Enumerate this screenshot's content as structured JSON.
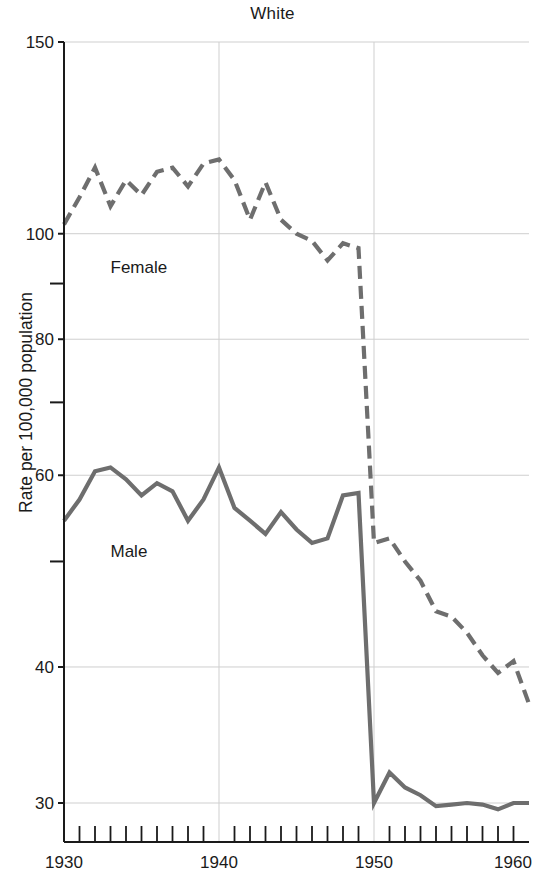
{
  "chart_data": {
    "type": "line",
    "title": "White",
    "xlabel": "",
    "ylabel": "Rate per 100,000 population",
    "yscale": "log",
    "ylim": [
      29,
      150
    ],
    "xlim": [
      1930,
      1960
    ],
    "grid": true,
    "legend_position": "inline-annotation",
    "y_major_ticks": [
      150,
      100,
      80,
      60,
      40,
      30
    ],
    "y_major_tick_labels": [
      "150",
      "100",
      "80",
      "60",
      "40",
      "30"
    ],
    "y_minor_ticks": [
      90,
      70,
      50
    ],
    "x_major_ticks": [
      1930,
      1940,
      1950,
      1960
    ],
    "x_major_tick_labels": [
      "1930",
      "1940",
      "1950",
      "1960"
    ],
    "x_minor_tick_step": 1,
    "line_color": "#6e6e6e",
    "series": [
      {
        "name": "Female",
        "style": "dashed",
        "x": [
          1930,
          1931,
          1932,
          1933,
          1934,
          1935,
          1936,
          1937,
          1938,
          1939,
          1940,
          1941,
          1942,
          1943,
          1944,
          1945,
          1946,
          1947,
          1948,
          1949,
          1950,
          1951,
          1952,
          1953,
          1954,
          1955,
          1956,
          1957,
          1958,
          1959,
          1960
        ],
        "values": [
          102,
          108,
          115,
          106,
          112,
          108.5,
          114,
          115,
          110.5,
          116,
          117,
          112,
          103,
          111.5,
          103,
          100,
          98.5,
          94.5,
          98,
          97,
          52,
          52.5,
          50,
          48,
          45,
          44.5,
          43,
          41,
          39.5,
          40.5,
          37
        ]
      },
      {
        "name": "Male",
        "style": "solid",
        "x": [
          1930,
          1931,
          1932,
          1933,
          1934,
          1935,
          1936,
          1937,
          1938,
          1939,
          1940,
          1941,
          1942,
          1943,
          1944,
          1945,
          1946,
          1947,
          1948,
          1949,
          1950,
          1951,
          1952,
          1953,
          1954,
          1955,
          1956,
          1957,
          1958,
          1959,
          1960
        ],
        "values": [
          54.5,
          57,
          60.5,
          61,
          59.5,
          57.5,
          59,
          58,
          54.5,
          57,
          61,
          56,
          54.5,
          53,
          55.5,
          53.5,
          52,
          52.5,
          57.5,
          57.8,
          30,
          32,
          31,
          30.5,
          29.8,
          29.9,
          30,
          29.9,
          29.6,
          30,
          30
        ]
      }
    ],
    "annotations": [
      {
        "text": "Female",
        "x": 1933.0,
        "y": 92.0
      },
      {
        "text": "Male",
        "x": 1933.0,
        "y": 50.5
      }
    ]
  }
}
